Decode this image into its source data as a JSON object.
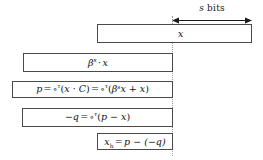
{
  "figure": {
    "background_color": "#ffffff",
    "line_color": "#4a4a4a",
    "guide_color": "#9a9a9a",
    "text_color": "#111111"
  },
  "annotation": {
    "measure_label_italic": "s",
    "measure_label_rest": " bits",
    "measure_label_full": "s bits",
    "arrow_style": "double-headed"
  },
  "rows": [
    {
      "id": "row-x",
      "label": "x",
      "expression_plain": "x"
    },
    {
      "id": "row-beta-x",
      "label": "beta^s times x",
      "expression_plain": "βˢ · x",
      "parts": {
        "base": "β",
        "exponent": "s",
        "dot": "·",
        "operand": "x"
      }
    },
    {
      "id": "row-p",
      "label": "p definition",
      "expression_plain": "p = ∘ᵀ(x · C) = ∘ᵀ(βˢx + x)",
      "parts": {
        "lhs": "p",
        "eq": "=",
        "ring": "∘",
        "ring_exponent": "τ",
        "first_arg": "x · C",
        "second_arg": "βˢx + x"
      }
    },
    {
      "id": "row-neg-q",
      "label": "negative q definition",
      "expression_plain": "−q = ∘ᵀ(p − x)",
      "parts": {
        "lhs": "−q",
        "eq": "=",
        "ring": "∘",
        "ring_exponent": "τ",
        "arg": "p − x"
      }
    },
    {
      "id": "row-xh",
      "label": "x_h definition",
      "expression_plain": "xₕ = p − (−q)",
      "parts": {
        "lhs_base": "x",
        "lhs_sub": "h",
        "eq": "=",
        "rhs": "p − (−q)"
      }
    }
  ]
}
